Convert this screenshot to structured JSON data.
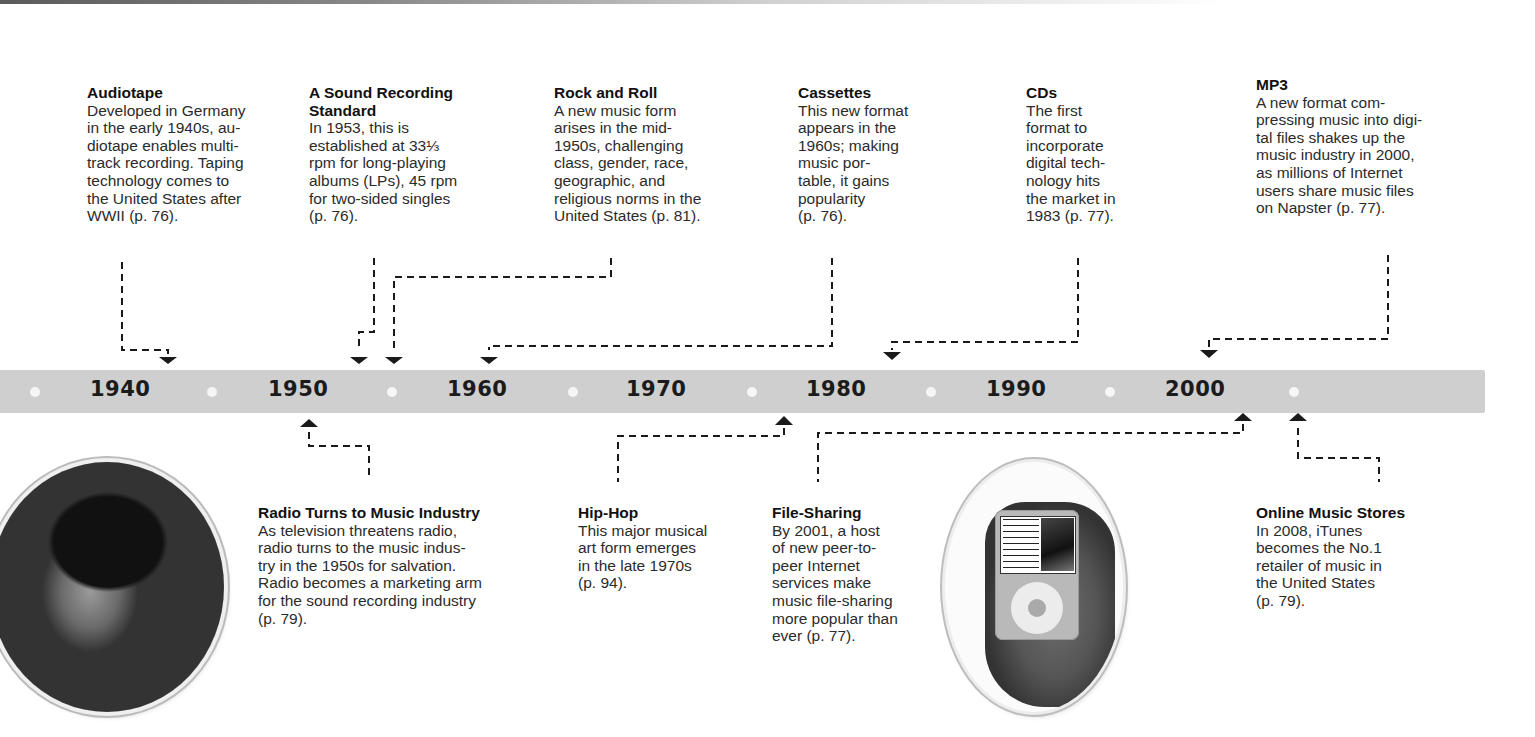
{
  "timeline": {
    "years": [
      "1940",
      "1950",
      "1960",
      "1970",
      "1980",
      "1990",
      "2000"
    ],
    "bar_color": "#cfcfcf",
    "dot_color": "#f6f6f6",
    "arrow_color": "#1a1a1a"
  },
  "events_above": [
    {
      "title": "Audiotape",
      "desc": "Developed in Germany\nin the early 1940s, au-\ndiotape enables multi-\ntrack recording. Taping\ntechnology comes to\nthe United States after\nWWII (p. 76)."
    },
    {
      "title": "A Sound Recording\nStandard",
      "desc": "In 1953, this is\nestablished at 33⅓\nrpm for long-playing\nalbums (LPs), 45 rpm\nfor two-sided singles\n(p. 76)."
    },
    {
      "title": "Rock and Roll",
      "desc": "A new music form\narises in the mid-\n1950s, challenging\nclass, gender, race,\ngeographic, and\nreligious norms in the\nUnited States (p. 81)."
    },
    {
      "title": "Cassettes",
      "desc": "This new format\nappears in the\n1960s; making\nmusic por-\ntable, it gains\npopularity\n(p. 76)."
    },
    {
      "title": "CDs",
      "desc": "The first\nformat to\nincorporate\ndigital tech-\nnology hits\nthe market in\n1983 (p. 77)."
    },
    {
      "title": "MP3",
      "desc": "A new format com-\npressing music into digi-\ntal files shakes up the\nmusic industry in 2000,\nas millions of Internet\nusers share music files\non Napster (p. 77)."
    }
  ],
  "events_below": [
    {
      "title": "Radio Turns to Music Industry",
      "desc": "As television threatens radio,\nradio turns to the music indus-\ntry in the 1950s for salvation.\nRadio becomes a marketing arm\nfor the sound recording industry\n(p. 79)."
    },
    {
      "title": "Hip-Hop",
      "desc": "This major musical\nart form emerges\nin the late 1970s\n(p. 94)."
    },
    {
      "title": "File-Sharing",
      "desc": "By 2001, a host\nof new peer-to-\npeer Internet\nservices make\nmusic file-sharing\nmore popular than\never (p. 77)."
    },
    {
      "title": "Online Music Stores",
      "desc": "In 2008, iTunes\nbecomes the No.1\nretailer of music in\nthe United States\n(p. 79)."
    }
  ],
  "images": {
    "left_photo": "singer-photo",
    "right_photo": "ipod-in-hand-photo"
  }
}
